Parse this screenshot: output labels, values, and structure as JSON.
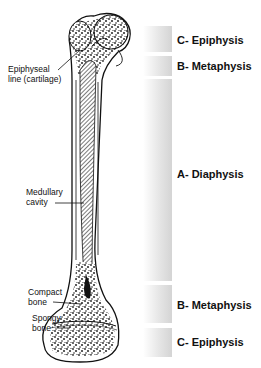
{
  "diagram": {
    "regions": [
      {
        "id": "proximal-epiphysis",
        "label": "C- Epiphysis",
        "top": 26,
        "height": 26,
        "label_y": 34
      },
      {
        "id": "proximal-metaphysis",
        "label": "B- Metaphysis",
        "top": 56,
        "height": 20,
        "label_y": 60
      },
      {
        "id": "diaphysis",
        "label": "A- Diaphysis",
        "top": 79,
        "height": 202,
        "label_y": 168
      },
      {
        "id": "distal-metaphysis",
        "label": "B- Metaphysis",
        "top": 285,
        "height": 38,
        "label_y": 299
      },
      {
        "id": "distal-epiphysis",
        "label": "C- Epiphysis",
        "top": 328,
        "height": 29,
        "label_y": 336
      }
    ],
    "callouts": [
      {
        "id": "epiphyseal-line",
        "line1": "Epiphyseal",
        "line2": "line (cartilage)"
      },
      {
        "id": "medullary-cavity",
        "line1": "Medullary",
        "line2": "cavity"
      },
      {
        "id": "compact-bone",
        "line1": "Compact",
        "line2": "bone"
      },
      {
        "id": "spongy-bone",
        "line1": "Spongy",
        "line2": "bone"
      }
    ],
    "colors": {
      "bar_light": "#ffffff",
      "bar_dark": "#d4d4d4",
      "ink": "#111111"
    }
  }
}
